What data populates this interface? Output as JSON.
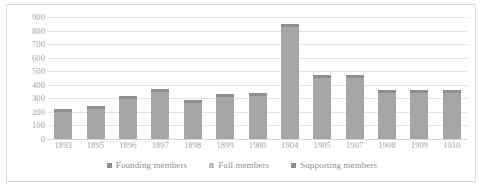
{
  "chart_data": {
    "type": "bar",
    "title": "",
    "subtitle": "",
    "xlabel": "",
    "ylabel": "",
    "grid": true,
    "legend_position": "bottom",
    "categories": [
      "1893",
      "1895",
      "1896",
      "1897",
      "1898",
      "1899",
      "1900",
      "1904",
      "1905",
      "1907",
      "1908",
      "1909",
      "1910"
    ],
    "ylim": [
      0,
      900
    ],
    "yticks": [
      0,
      100,
      200,
      300,
      400,
      500,
      600,
      700,
      800,
      900
    ],
    "ytick_labels": [
      "0",
      "100",
      "200",
      "300",
      "400",
      "500",
      "600",
      "700",
      "800",
      "900"
    ],
    "series": [
      {
        "name": "Founding members",
        "color": "#a6a6a6",
        "values": [
          225,
          240,
          315,
          370,
          285,
          330,
          340,
          845,
          475,
          470,
          360,
          360,
          360
        ]
      },
      {
        "name": "Full members",
        "color": "#bfbfbf",
        "values": [
          0,
          0,
          0,
          0,
          0,
          0,
          0,
          0,
          0,
          0,
          0,
          0,
          0
        ]
      },
      {
        "name": "Supporting members",
        "color": "#8f8f8f",
        "values": [
          0,
          0,
          0,
          0,
          0,
          0,
          0,
          0,
          0,
          0,
          0,
          0,
          0
        ]
      }
    ]
  },
  "legend": {
    "items": [
      {
        "label": "Founding members",
        "color": "#8f8f8f"
      },
      {
        "label": "Full members",
        "color": "#bfbfbf"
      },
      {
        "label": "Supporting members",
        "color": "#8f8f8f"
      }
    ]
  }
}
